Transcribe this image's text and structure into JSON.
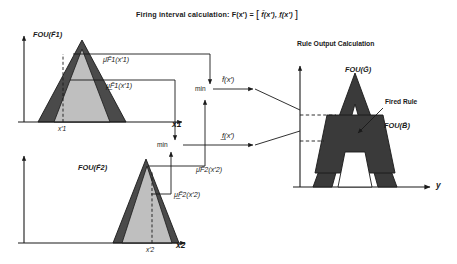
{
  "figure": {
    "title": "Firing interval calculation: F(x′) = [ f̄(x′), f̲(x′) ]",
    "title_prefix": "Firing interval calculation:",
    "title_formula": "F(x′) =",
    "title_upper_f": "f̄(x′),",
    "title_lower_f": "f̲(x′)",
    "bracket_open": "[",
    "bracket_close": "]"
  },
  "antecedent_1": {
    "fou_label": "FOU(F̃1)",
    "upper_membership_label": "μ̄F̃1(x′1)",
    "lower_membership_label": "μ̲F̃1(x′1)",
    "axis_label": "x1",
    "input_tick_label": "x′1"
  },
  "antecedent_2": {
    "fou_label": "FOU(F̃2)",
    "upper_membership_label": "μ̄F̃2(x′2)",
    "lower_membership_label": "μ̲F̃2(x′2)",
    "axis_label": "x2",
    "input_tick_label": "x′2"
  },
  "operators": {
    "min_upper_label": "min",
    "min_lower_label": "min",
    "upper_firing_label": "f̄(x′)",
    "lower_firing_label": "f̲(x′)"
  },
  "consequent": {
    "panel_title": "Rule Output Calculation",
    "fou_g_label": "FOU(G̃)",
    "fou_b_label": "FOU(B̃)",
    "fired_rule_label": "Fired Rule",
    "axis_label": "y"
  },
  "colors": {
    "background": "#ffffff",
    "stroke": "#1a1a1a",
    "umf_fill": "#4a4a4a",
    "lmf_fill": "#bfbfbf",
    "fired_fill": "#3a3a3a",
    "text": "#1a1a1a"
  }
}
